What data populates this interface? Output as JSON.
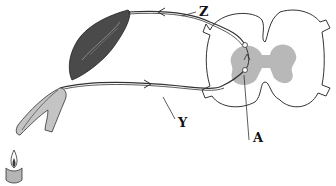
{
  "diagram": {
    "type": "reflex-arc",
    "labels": {
      "z": "Z",
      "y": "Y",
      "a": "A"
    },
    "parts": {
      "effector": "muscle",
      "receptor": "hand",
      "stimulus": "candle-flame",
      "center": "spinal-cord-cross-section"
    },
    "colors": {
      "outline": "#333333",
      "grey_matter": "#b8b8b8",
      "muscle": "#4a4a4a",
      "hand": "#c4c4c4",
      "candle": "#b5b5b5",
      "flame_inner": "#3a3a3a"
    }
  }
}
